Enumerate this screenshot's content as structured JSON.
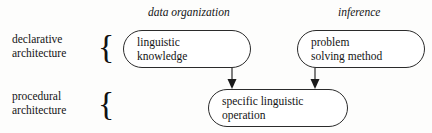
{
  "diagram": {
    "type": "architecture-diagram",
    "background_color": "#fdfdfc",
    "line_color": "#2b2b2b",
    "text_color": "#141414",
    "column_headers": [
      {
        "id": "data-organization",
        "label": "data organization",
        "style": "italic"
      },
      {
        "id": "inference",
        "label": "inference",
        "style": "italic"
      }
    ],
    "row_labels": [
      {
        "id": "declarative",
        "line1": "declarative",
        "line2": "architecture",
        "brace": "{"
      },
      {
        "id": "procedural",
        "line1": "procedural",
        "line2": "architecture",
        "brace": "{"
      }
    ],
    "nodes": [
      {
        "id": "linguistic-knowledge",
        "label": "linguistic\nknowledge",
        "row": "declarative",
        "column": "data organization",
        "shape": "rounded-rectangle"
      },
      {
        "id": "problem-solving-method",
        "label": "problem\nsolving method",
        "row": "declarative",
        "column": "inference",
        "shape": "rounded-rectangle"
      },
      {
        "id": "specific-linguistic-operation",
        "label": "specific linguistic\noperation",
        "row": "procedural",
        "column": "center",
        "shape": "rounded-rectangle"
      }
    ],
    "arrows": [
      {
        "id": "arrow-knowledge-to-operation",
        "from": "linguistic-knowledge",
        "to": "specific-linguistic-operation",
        "direction": "down"
      },
      {
        "id": "arrow-method-to-operation",
        "from": "problem-solving-method",
        "to": "specific-linguistic-operation",
        "direction": "down"
      }
    ]
  }
}
